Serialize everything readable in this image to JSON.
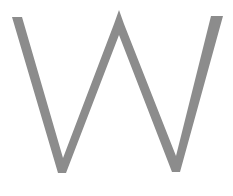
{
  "glyph": {
    "character": "W",
    "color": "#8c8c8c",
    "stroke_width": 10,
    "background": "#ffffff"
  }
}
